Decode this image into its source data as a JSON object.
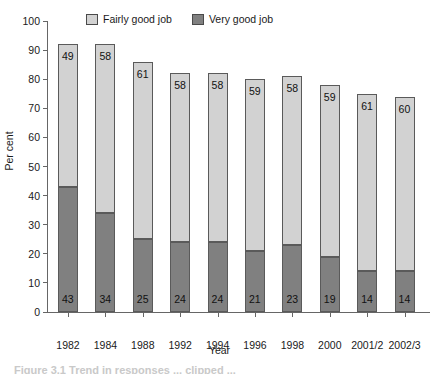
{
  "chart_data": {
    "type": "bar",
    "stacked": true,
    "title": "",
    "xlabel": "Year",
    "ylabel": "Per cent",
    "ylim": [
      0,
      100
    ],
    "yticks": [
      0,
      10,
      20,
      30,
      40,
      50,
      60,
      70,
      80,
      90,
      100
    ],
    "grid": false,
    "legend_position": "top-center",
    "categories": [
      "1982",
      "1984",
      "1988",
      "1992",
      "1994",
      "1996",
      "1998",
      "2000",
      "2001/2",
      "2002/3"
    ],
    "series": [
      {
        "name": "Very good job",
        "color": "#808080",
        "values": [
          43,
          34,
          25,
          24,
          24,
          21,
          23,
          19,
          14,
          14
        ]
      },
      {
        "name": "Fairly good job",
        "color": "#d2d2d2",
        "values": [
          49,
          58,
          61,
          58,
          58,
          59,
          58,
          59,
          61,
          60
        ]
      }
    ],
    "stack_totals": [
      92,
      92,
      86,
      82,
      82,
      80,
      81,
      78,
      75,
      74
    ],
    "stack_order": [
      "Very good job",
      "Fairly good job"
    ]
  },
  "legend": {
    "entries": [
      {
        "label": "Fairly good job",
        "color": "#d2d2d2"
      },
      {
        "label": "Very good job",
        "color": "#808080"
      }
    ]
  },
  "axes": {
    "y_title": "Per cent",
    "x_title": "Year"
  },
  "caption": {
    "fragment": "Figure 3.1   Trend in responses ... clipped ..."
  }
}
